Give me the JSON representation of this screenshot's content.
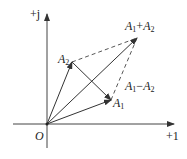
{
  "diagram": {
    "type": "phasor-diagram",
    "axes": {
      "imag_label": "+j",
      "real_label": "+1",
      "origin_label": "O"
    },
    "vectors": [
      {
        "name": "A1",
        "base": "A",
        "sub": "1",
        "from": "O",
        "style": "solid"
      },
      {
        "name": "A2",
        "base": "A",
        "sub": "2",
        "from": "O",
        "style": "solid"
      },
      {
        "name": "A1+A2",
        "from": "O",
        "style": "solid"
      },
      {
        "name": "A1-A2",
        "from": "A2",
        "to": "A1",
        "style": "solid"
      }
    ],
    "dashed_lines": [
      {
        "from": "A2",
        "to": "A1+A2"
      },
      {
        "from": "A1",
        "to": "A1+A2"
      }
    ],
    "labels": {
      "a1": {
        "base": "A",
        "sub": "1"
      },
      "a2": {
        "base": "A",
        "sub": "2"
      },
      "sum": {
        "base1": "A",
        "sub1": "1",
        "op": "+",
        "base2": "A",
        "sub2": "2"
      },
      "diff": {
        "base1": "A",
        "sub1": "1",
        "op": "−",
        "base2": "A",
        "sub2": "2"
      }
    },
    "colors": {
      "line": "#333333",
      "background": "#ffffff"
    }
  }
}
